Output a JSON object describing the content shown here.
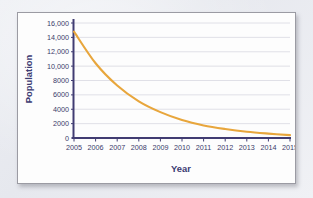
{
  "figure": {
    "frame_border_color": "#9b9ba3",
    "plot_background": "#fdfdfd",
    "page_background": "#e9eaef"
  },
  "chart_data": {
    "type": "line",
    "title": "",
    "xlabel": "Year",
    "ylabel": "Population",
    "x": [
      2005,
      2006,
      2007,
      2008,
      2009,
      2010,
      2011,
      2012,
      2013,
      2014,
      2015
    ],
    "values": [
      14800,
      10400,
      7300,
      5100,
      3600,
      2500,
      1750,
      1250,
      870,
      610,
      400
    ],
    "series": [
      {
        "name": "Population",
        "color": "#e8a63c",
        "values": [
          14800,
          10400,
          7300,
          5100,
          3600,
          2500,
          1750,
          1250,
          870,
          610,
          400
        ]
      }
    ],
    "xtick_labels": [
      "2005",
      "2006",
      "2007",
      "2008",
      "2009",
      "2010",
      "2011",
      "2012",
      "2013",
      "2014",
      "2015"
    ],
    "ytick_values": [
      0,
      2000,
      4000,
      6000,
      8000,
      10000,
      12000,
      14000,
      16000
    ],
    "ytick_labels": [
      "0",
      "2000",
      "4000",
      "6000",
      "8000",
      "10,000",
      "12,000",
      "14,000",
      "16,000"
    ],
    "xlim": [
      2005,
      2015
    ],
    "ylim": [
      0,
      16000
    ],
    "grid": "horizontal",
    "legend": "none",
    "axis_color": "#413c72",
    "gridline_color": "#dcdce4",
    "label_color": "#3a3a6a"
  }
}
